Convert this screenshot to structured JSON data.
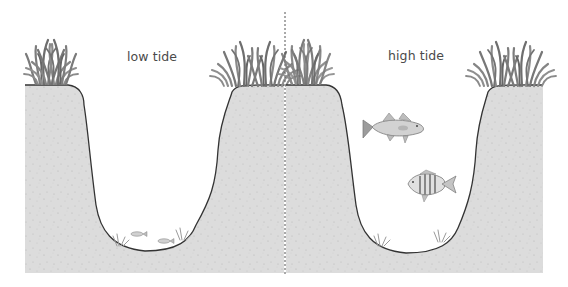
{
  "panels": [
    {
      "label": "low tide",
      "water": "low",
      "fish": [
        {
          "kind": "small-fish",
          "count": 2
        }
      ]
    },
    {
      "label": "high tide",
      "water": "high",
      "fish": [
        {
          "kind": "bass-fish"
        },
        {
          "kind": "striped-fish"
        }
      ]
    }
  ],
  "colors": {
    "ground": "#dcdcdc",
    "ground_speckle": "#b9b9b9",
    "outline": "#333333",
    "grass": "#8a8a8a",
    "grass_dark": "#5e5e5e",
    "water": "#ffffff",
    "label": "#4a4a4a",
    "divider": "#555555"
  }
}
